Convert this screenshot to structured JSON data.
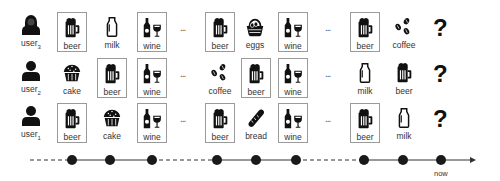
{
  "rows": [
    {
      "user": {
        "name": "user",
        "sub": "3"
      },
      "items": [
        {
          "label": "beer",
          "icon": "beer-icon",
          "boxed": true
        },
        {
          "label": "milk",
          "icon": "milk-icon",
          "boxed": false
        },
        {
          "label": "wine",
          "icon": "wine-icon",
          "boxed": true
        },
        {
          "label": "beer",
          "icon": "beer-icon",
          "boxed": true
        },
        {
          "label": "eggs",
          "icon": "eggs-icon",
          "boxed": false
        },
        {
          "label": "wine",
          "icon": "wine-icon",
          "boxed": true
        },
        {
          "label": "beer",
          "icon": "beer-icon",
          "boxed": true
        },
        {
          "label": "coffee",
          "icon": "coffee-icon",
          "boxed": false
        }
      ],
      "unknown": "?"
    },
    {
      "user": {
        "name": "user",
        "sub": "2"
      },
      "items": [
        {
          "label": "cake",
          "icon": "cake-icon",
          "boxed": false
        },
        {
          "label": "beer",
          "icon": "beer-icon",
          "boxed": true
        },
        {
          "label": "wine",
          "icon": "wine-icon",
          "boxed": true
        },
        {
          "label": "coffee",
          "icon": "coffee-icon",
          "boxed": false
        },
        {
          "label": "beer",
          "icon": "beer-icon",
          "boxed": true
        },
        {
          "label": "wine",
          "icon": "wine-icon",
          "boxed": true
        },
        {
          "label": "milk",
          "icon": "milk-icon",
          "boxed": false
        },
        {
          "label": "beer",
          "icon": "beer-icon",
          "boxed": false
        }
      ],
      "unknown": "?"
    },
    {
      "user": {
        "name": "user",
        "sub": "1"
      },
      "items": [
        {
          "label": "beer",
          "icon": "beer-icon",
          "boxed": true
        },
        {
          "label": "cake",
          "icon": "cake-icon",
          "boxed": false
        },
        {
          "label": "wine",
          "icon": "wine-icon",
          "boxed": true
        },
        {
          "label": "beer",
          "icon": "beer-icon",
          "boxed": true
        },
        {
          "label": "bread",
          "icon": "bread-icon",
          "boxed": false
        },
        {
          "label": "wine",
          "icon": "wine-icon",
          "boxed": true
        },
        {
          "label": "beer",
          "icon": "beer-icon",
          "boxed": true
        },
        {
          "label": "milk",
          "icon": "milk-icon",
          "boxed": false
        }
      ],
      "unknown": "?"
    }
  ],
  "ellipsis": "...",
  "timeline": {
    "label_now": "now",
    "dot_count": 9
  },
  "colors": {
    "box_border": "#9a9a9a",
    "icon": "#111111",
    "line": "#333333"
  }
}
